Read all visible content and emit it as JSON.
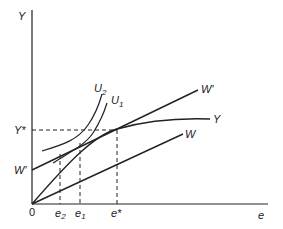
{
  "diagram": {
    "axes": {
      "y_label": "Y",
      "x_label": "e",
      "origin_label": "0"
    },
    "curves": {
      "w_prime_label": "W′",
      "y_label": "Y",
      "w_label": "W",
      "u2_label": "U",
      "u2_sub": "2",
      "u1_label": "U",
      "u1_sub": "1"
    },
    "markers": {
      "y_star_label": "Y*",
      "w_prime_intercept_label": "W′",
      "e2_label": "e",
      "e2_sub": "2",
      "e1_label": "e",
      "e1_sub": "1",
      "e_star_label": "e*"
    },
    "colors": {
      "line": "#222222",
      "background": "#ffffff"
    }
  }
}
